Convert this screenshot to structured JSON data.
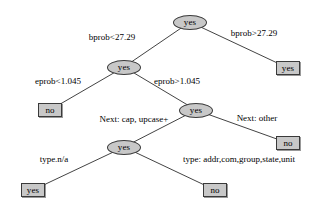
{
  "diagram": {
    "type": "decision-tree",
    "title": "",
    "node_fill_color": "#c8c8c8",
    "node_stroke_color": "#3a3a3a",
    "background_color": "#ffffff",
    "nodes": [
      {
        "id": "root",
        "shape": "ellipse",
        "label": "yes",
        "x": 190,
        "y": 22
      },
      {
        "id": "n2",
        "shape": "ellipse",
        "label": "yes",
        "x": 124,
        "y": 67
      },
      {
        "id": "leaf_r1",
        "shape": "box",
        "label": "yes",
        "x": 288,
        "y": 68
      },
      {
        "id": "leaf_l1",
        "shape": "box",
        "label": "no",
        "x": 50,
        "y": 110
      },
      {
        "id": "n3",
        "shape": "ellipse",
        "label": "yes",
        "x": 196,
        "y": 110
      },
      {
        "id": "leaf_r2",
        "shape": "box",
        "label": "no",
        "x": 288,
        "y": 143
      },
      {
        "id": "n4",
        "shape": "ellipse",
        "label": "yes",
        "x": 124,
        "y": 147
      },
      {
        "id": "leaf_l3",
        "shape": "box",
        "label": "yes",
        "x": 33,
        "y": 190
      },
      {
        "id": "leaf_r3",
        "shape": "box",
        "label": "no",
        "x": 215,
        "y": 190
      }
    ],
    "edges": [
      {
        "from": "root",
        "to": "n2",
        "label": "bprob<27.29",
        "label_x": 112,
        "label_y": 37
      },
      {
        "from": "root",
        "to": "leaf_r1",
        "label": "bprob>27.29",
        "label_x": 254,
        "label_y": 33
      },
      {
        "from": "n2",
        "to": "leaf_l1",
        "label": "eprob<1.045",
        "label_x": 58,
        "label_y": 81
      },
      {
        "from": "n2",
        "to": "n3",
        "label": "eprob>1.045",
        "label_x": 177,
        "label_y": 81
      },
      {
        "from": "n3",
        "to": "n4",
        "label": "Next: cap, upcase+",
        "label_x": 134,
        "label_y": 119
      },
      {
        "from": "n3",
        "to": "leaf_r2",
        "label": "Next: other",
        "label_x": 257,
        "label_y": 118
      },
      {
        "from": "n4",
        "to": "leaf_l3",
        "label": "type.n/a",
        "label_x": 54,
        "label_y": 159
      },
      {
        "from": "n4",
        "to": "leaf_r3",
        "label": "type: addr,com,group,state,unit",
        "label_x": 239,
        "label_y": 159
      }
    ]
  }
}
